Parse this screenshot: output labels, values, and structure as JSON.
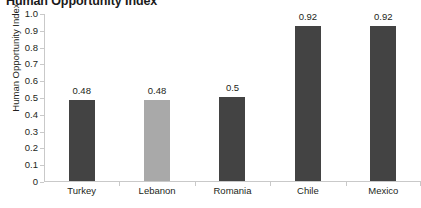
{
  "chart_data": {
    "type": "bar",
    "title": "Human Opportunity Index",
    "xlabel": "",
    "ylabel": "Human Opportunity Index",
    "categories": [
      "Turkey",
      "Lebanon",
      "Romania",
      "Chile",
      "Mexico"
    ],
    "values": [
      0.48,
      0.48,
      0.5,
      0.92,
      0.92
    ],
    "value_labels": [
      "0.48",
      "0.48",
      "0.5",
      "0.92",
      "0.92"
    ],
    "bar_colors": [
      "#434343",
      "#a9a9a9",
      "#434343",
      "#434343",
      "#434343"
    ],
    "ylim": [
      0,
      1.0
    ],
    "ytick_labels": [
      "1.0",
      "0.9",
      "0.8",
      "0.7",
      "0.6",
      "0.5",
      "0.4",
      "0.3",
      "0.2",
      "0.1",
      "0"
    ],
    "ytick_values": [
      1.0,
      0.9,
      0.8,
      0.7,
      0.6,
      0.5,
      0.4,
      0.3,
      0.2,
      0.1,
      0
    ],
    "grid": false,
    "legend": "none",
    "axis_color": "#c9c9c9",
    "text_color": "#231f20",
    "background": "#ffffff"
  }
}
